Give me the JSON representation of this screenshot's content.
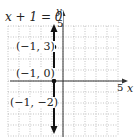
{
  "chart_data": {
    "type": "line",
    "title": "",
    "equation_label": "x + 1 = 0",
    "xlabel": "x",
    "ylabel": "y",
    "xlim": [
      -5,
      5
    ],
    "ylim": [
      -5,
      5
    ],
    "grid": true,
    "tick_labels": {
      "x": "5",
      "y": "5"
    },
    "series": [
      {
        "name": "x + 1 = 0",
        "kind": "vertical-line",
        "x": -1,
        "color": "#111111"
      }
    ],
    "points": [
      {
        "x": -1,
        "y": 3,
        "label": "(−1, 3)"
      },
      {
        "x": -1,
        "y": 0,
        "label": "(−1, 0)"
      },
      {
        "x": -1,
        "y": -2,
        "label": "(−1, −2)"
      }
    ]
  },
  "labels": {
    "equation": "x + 1 = 0",
    "x_axis": "x",
    "y_axis": "y",
    "x_tick": "5",
    "y_tick": "5",
    "p1": "(−1, 3)",
    "p2": "(−1, 0)",
    "p3": "(−1, −2)"
  }
}
